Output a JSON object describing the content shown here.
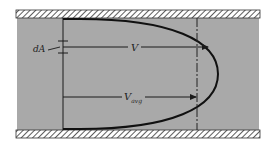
{
  "diagram": {
    "labels": {
      "area_element": "dA",
      "local_velocity": "V",
      "avg_velocity_main": "V",
      "avg_velocity_sub": "avg"
    },
    "colors": {
      "fluid": "#a9a9a9",
      "wall": "#ffffff",
      "hatch": "#333333",
      "line": "#1a1a1a"
    },
    "elements": [
      "top-pipe-wall",
      "bottom-pipe-wall",
      "fluid-region",
      "reference-plane-line",
      "velocity-profile-curve",
      "average-velocity-dashed-line",
      "local-velocity-arrow",
      "average-velocity-arrow",
      "area-element-marker"
    ]
  }
}
